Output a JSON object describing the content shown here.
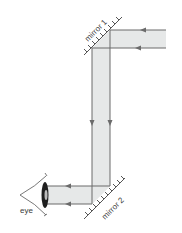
{
  "diagram": {
    "type": "periscope-ray-diagram",
    "labels": {
      "mirror1": "mirror 1",
      "mirror2": "mirror 2",
      "eye": "eye"
    },
    "colors": {
      "beam_fill": "#e6e8e8",
      "ray_line": "#6b6b6b",
      "mirror_line": "#555555",
      "text": "#3a3a3a",
      "background": "#ffffff"
    },
    "rays": [
      {
        "name": "upper-ray",
        "path": "enters right at mirror 1, reflects down, reflects at mirror 2 to eye"
      },
      {
        "name": "lower-ray",
        "path": "enters right at mirror 1, reflects down, reflects at mirror 2 to eye"
      }
    ]
  }
}
